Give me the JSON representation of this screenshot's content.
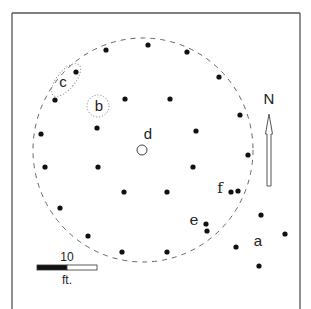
{
  "diagram": {
    "type": "site-plan",
    "frame": {
      "left": 12,
      "top": 13,
      "right": 300,
      "bottom": 309,
      "stroke": "#555555"
    },
    "boundary_circle": {
      "cx": 143,
      "cy": 150,
      "rx": 110,
      "ry": 112,
      "style": "dashed",
      "stroke": "#666666"
    },
    "post_holes": [
      {
        "x": 106,
        "y": 50
      },
      {
        "x": 148,
        "y": 45
      },
      {
        "x": 187,
        "y": 52
      },
      {
        "x": 76,
        "y": 72
      },
      {
        "x": 219,
        "y": 77
      },
      {
        "x": 55,
        "y": 100
      },
      {
        "x": 125,
        "y": 99
      },
      {
        "x": 170,
        "y": 99
      },
      {
        "x": 240,
        "y": 115
      },
      {
        "x": 41,
        "y": 134
      },
      {
        "x": 97,
        "y": 128
      },
      {
        "x": 196,
        "y": 131
      },
      {
        "x": 248,
        "y": 155
      },
      {
        "x": 45,
        "y": 167
      },
      {
        "x": 98,
        "y": 167
      },
      {
        "x": 193,
        "y": 167
      },
      {
        "x": 124,
        "y": 192
      },
      {
        "x": 167,
        "y": 192
      },
      {
        "x": 231,
        "y": 192
      },
      {
        "x": 238,
        "y": 191
      },
      {
        "x": 60,
        "y": 208
      },
      {
        "x": 261,
        "y": 215
      },
      {
        "x": 206,
        "y": 224
      },
      {
        "x": 207,
        "y": 231
      },
      {
        "x": 88,
        "y": 236
      },
      {
        "x": 285,
        "y": 234
      },
      {
        "x": 236,
        "y": 247
      },
      {
        "x": 122,
        "y": 252
      },
      {
        "x": 167,
        "y": 252
      },
      {
        "x": 259,
        "y": 266
      }
    ],
    "features": {
      "a": {
        "label": "a",
        "x": 258,
        "y": 246
      },
      "b": {
        "label": "b",
        "x": 99,
        "y": 111,
        "circle": {
          "cx": 98,
          "cy": 106,
          "r": 11
        }
      },
      "c": {
        "label": "c",
        "x": 63,
        "y": 87,
        "ellipse": {
          "cx": 66,
          "cy": 80,
          "rx": 9,
          "ry": 20,
          "rotate": 40
        }
      },
      "d": {
        "label": "d",
        "x": 148,
        "y": 139,
        "hearth": {
          "cx": 142,
          "cy": 150,
          "r": 5
        }
      },
      "e": {
        "label": "e",
        "x": 194,
        "y": 225
      },
      "f": {
        "label": "f",
        "x": 220,
        "y": 193
      }
    },
    "north_arrow": {
      "label": "N",
      "label_x": 269,
      "label_y": 104,
      "tip_y": 114,
      "head_base_y": 134,
      "shaft_bottom_y": 186,
      "x": 269
    },
    "scale_bar": {
      "value_label": "10",
      "unit_label": "ft.",
      "x": 37,
      "y": 265,
      "width": 60,
      "height": 5,
      "black_fraction": 0.5
    }
  }
}
